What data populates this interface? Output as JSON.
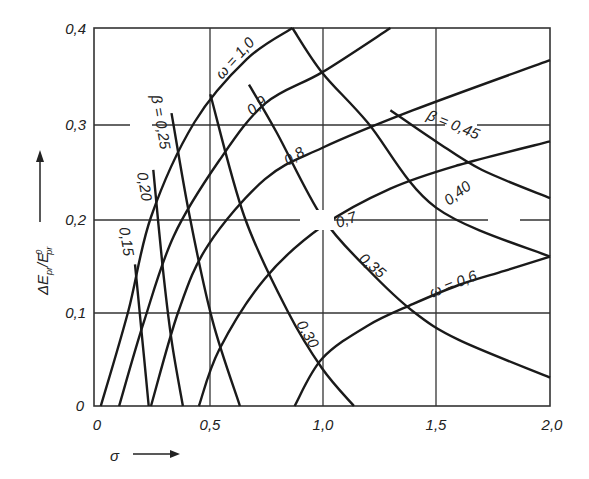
{
  "chart_data": {
    "type": "line",
    "title": "",
    "xlabel": "σ",
    "ylabel": "ΔE_pr/E⁰_pr",
    "xlim": [
      0,
      2.0
    ],
    "ylim": [
      0,
      0.4
    ],
    "grid": true,
    "x_ticks": [
      "0",
      "0,5",
      "1,0",
      "1,5",
      "2,0"
    ],
    "y_ticks": [
      "0",
      "0,1",
      "0,2",
      "0,3",
      "0,4"
    ],
    "series": [
      {
        "name": "ω = 1,0",
        "family": "omega",
        "label": "ω = 1,0",
        "x": [
          0.03,
          0.15,
          0.25,
          0.44,
          0.67,
          0.87
        ],
        "y": [
          0.0,
          0.1,
          0.2,
          0.3,
          0.367,
          0.4
        ]
      },
      {
        "name": "ω = 0,9",
        "family": "omega",
        "label": "0,9",
        "x": [
          0.11,
          0.22,
          0.35,
          0.55,
          0.75,
          1.0,
          1.3
        ],
        "y": [
          0.0,
          0.09,
          0.18,
          0.26,
          0.32,
          0.353,
          0.4
        ]
      },
      {
        "name": "ω = 0,8",
        "family": "omega",
        "label": "0,8",
        "x": [
          0.25,
          0.37,
          0.5,
          0.75,
          1.0,
          1.4,
          2.0
        ],
        "y": [
          0.0,
          0.1,
          0.17,
          0.24,
          0.273,
          0.313,
          0.366
        ]
      },
      {
        "name": "ω = 0,7",
        "family": "omega",
        "label": "0,7",
        "x": [
          0.46,
          0.55,
          0.75,
          1.0,
          1.3,
          1.6,
          2.0
        ],
        "y": [
          0.0,
          0.06,
          0.135,
          0.19,
          0.23,
          0.255,
          0.28
        ]
      },
      {
        "name": "ω = 0,6",
        "family": "omega",
        "label": "ω = 0,6",
        "x": [
          0.88,
          1.0,
          1.2,
          1.4,
          1.6,
          1.8,
          2.0
        ],
        "y": [
          0.0,
          0.05,
          0.085,
          0.108,
          0.128,
          0.143,
          0.158
        ]
      },
      {
        "name": "β = 0,15",
        "family": "beta",
        "label": "0,15",
        "x": [
          0.18,
          0.2,
          0.22,
          0.24
        ],
        "y": [
          0.15,
          0.1,
          0.05,
          0.0
        ]
      },
      {
        "name": "β = 0,20",
        "family": "beta",
        "label": "0,20",
        "x": [
          0.26,
          0.3,
          0.34,
          0.39
        ],
        "y": [
          0.25,
          0.15,
          0.07,
          0.0
        ]
      },
      {
        "name": "β = 0,25",
        "family": "beta",
        "label": "β = 0,25",
        "x": [
          0.34,
          0.42,
          0.52,
          0.64
        ],
        "y": [
          0.31,
          0.2,
          0.09,
          0.0
        ]
      },
      {
        "name": "β = 0,30",
        "family": "beta",
        "label": "0,30",
        "x": [
          0.51,
          0.66,
          0.85,
          1.0,
          1.14
        ],
        "y": [
          0.33,
          0.2,
          0.1,
          0.04,
          0.0
        ]
      },
      {
        "name": "β = 0,35",
        "family": "beta",
        "label": "0,35",
        "x": [
          0.68,
          0.8,
          1.0,
          1.2,
          1.4,
          1.6,
          2.0
        ],
        "y": [
          0.34,
          0.29,
          0.2,
          0.145,
          0.1,
          0.07,
          0.03
        ]
      },
      {
        "name": "β = 0,40",
        "family": "beta",
        "label": "0,40",
        "x": [
          0.87,
          1.0,
          1.2,
          1.5,
          2.0
        ],
        "y": [
          0.4,
          0.353,
          0.3,
          0.21,
          0.158
        ]
      },
      {
        "name": "β = 0,45",
        "family": "beta",
        "label": "β = 0,45",
        "x": [
          1.3,
          1.5,
          1.7,
          2.0
        ],
        "y": [
          0.313,
          0.28,
          0.25,
          0.22
        ]
      }
    ],
    "annotations": [
      "ω = 1,0",
      "0,9",
      "0,8",
      "0,7",
      "ω = 0,6",
      "β = 0,25",
      "0,20",
      "0,15",
      "0,30",
      "0,35",
      "0,40",
      "β = 0,45"
    ]
  },
  "axes": {
    "x_label": "σ",
    "y_label_main": "ΔE",
    "y_label_sub1": "pr",
    "y_label_slash": "/E",
    "y_label_sup": "0",
    "y_label_sub2": "pr"
  },
  "labels": {
    "omega_10": "ω = 1,0",
    "omega_09": "0,9",
    "omega_08": "0,8",
    "omega_07": "0,7",
    "omega_06": "ω = 0,6",
    "beta_025": "β = 0,25",
    "beta_020": "0,20",
    "beta_015": "0,15",
    "beta_030": "0,30",
    "beta_035": "0,35",
    "beta_040": "0,40",
    "beta_045": "β = 0,45"
  }
}
